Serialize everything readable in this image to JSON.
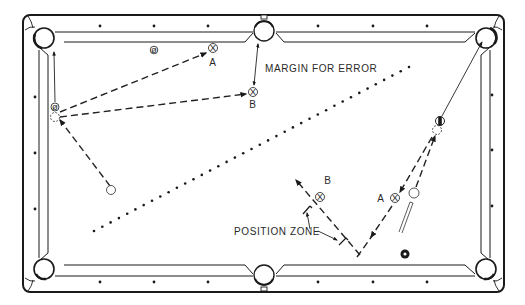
{
  "diagram": {
    "colors": {
      "ink": "#1a1a1a",
      "background": "#ffffff"
    },
    "labels": {
      "margin_for_error": "MARGIN FOR ERROR",
      "position_zone": "POSITION ZONE",
      "top_a": "A",
      "top_b": "B",
      "bottom_a": "A",
      "bottom_b": "B"
    },
    "pockets": [
      "top-left",
      "top-middle",
      "top-right",
      "bottom-left",
      "bottom-middle",
      "bottom-right"
    ],
    "balls": {
      "left_object_ball_marking": "ø",
      "top_object_ball_marking": "ø",
      "target_marking": "X"
    },
    "diamonds": {
      "top_count": 6,
      "bottom_count": 6,
      "left_count": 3,
      "right_count": 3
    }
  }
}
